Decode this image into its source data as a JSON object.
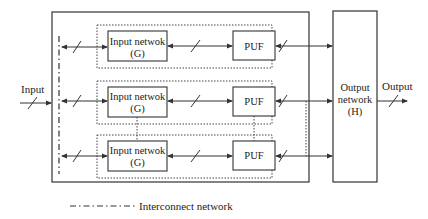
{
  "diagram": {
    "input_label": "Input",
    "output_label": "Output",
    "output_network": {
      "line1": "Output",
      "line2": "network",
      "line3": "(H)"
    },
    "modules": [
      {
        "input_network": {
          "line1": "Input netwok",
          "line2": "(G)"
        },
        "puf": "PUF"
      },
      {
        "input_network": {
          "line1": "Input netwok",
          "line2": "(G)"
        },
        "puf": "PUF"
      },
      {
        "input_network": {
          "line1": "Input netwok",
          "line2": "(G)"
        },
        "puf": "PUF"
      }
    ],
    "legend": {
      "interconnect": "Interconnect network"
    },
    "colors": {
      "line": "#333333",
      "background": "#ffffff"
    }
  }
}
